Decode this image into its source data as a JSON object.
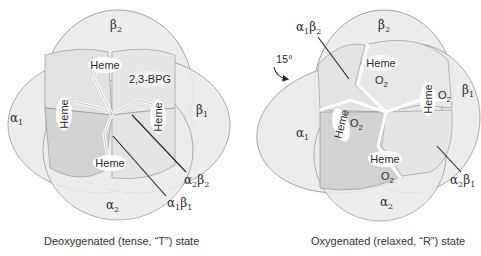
{
  "colors": {
    "background": "#ffffff",
    "subunit_light": "#ececec",
    "subunit_mid": "#e3e3e3",
    "subunit_dark": "#cfcfcf",
    "outline": "#8a8a8a",
    "leader_line": "#222222",
    "heme_bubble": "#ffffff"
  },
  "deoxy": {
    "caption": "Deoxygenated (tense, “T”) state",
    "subunits": {
      "beta2": {
        "greek": "β",
        "sub": "2"
      },
      "beta1": {
        "greek": "β",
        "sub": "1"
      },
      "alpha1": {
        "greek": "α",
        "sub": "1"
      },
      "alpha2": {
        "greek": "α",
        "sub": "2"
      }
    },
    "heme_label": "Heme",
    "bpg_label": "2,3-BPG",
    "interfaces": {
      "a2b2": {
        "g1": "α",
        "s1": "2",
        "g2": "β",
        "s2": "2"
      },
      "a1b1": {
        "g1": "α",
        "s1": "1",
        "g2": "β",
        "s2": "1"
      }
    }
  },
  "oxy": {
    "caption": "Oxygenated (relaxed, “R”) state",
    "subunits": {
      "beta2": {
        "greek": "β",
        "sub": "2"
      },
      "beta1": {
        "greek": "β",
        "sub": "1"
      },
      "alpha1": {
        "greek": "α",
        "sub": "1"
      },
      "alpha2": {
        "greek": "α",
        "sub": "2"
      }
    },
    "heme_label": "Heme",
    "o2": {
      "base": "O",
      "sub": "2"
    },
    "rotation_label": "15°",
    "interfaces": {
      "a1b2": {
        "g1": "α",
        "s1": "1",
        "g2": "β",
        "s2": "2"
      },
      "a2b1": {
        "g1": "α",
        "s1": "2",
        "g2": "β",
        "s2": "1"
      }
    }
  }
}
